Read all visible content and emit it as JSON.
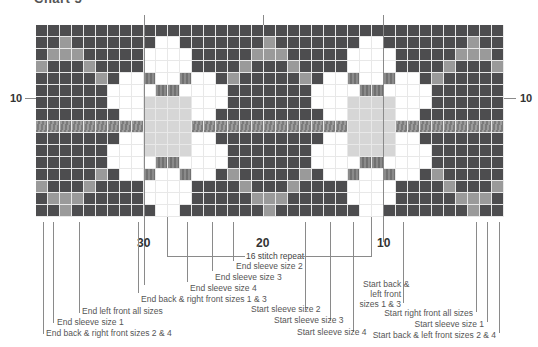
{
  "title": "Chart 5",
  "grid": {
    "cols": 39,
    "rows": 16,
    "legend": {
      "D": "main dark color",
      "G": "grey contrast",
      "W": "white flower",
      "M": "mid grey accent",
      "L": "light grey center",
      "S": "striped band"
    },
    "colors": {
      "D": "#4d4d4f",
      "G": "#9a9a9a",
      "W": "#ffffff",
      "M": "#7a7a7a",
      "L": "#d6d6d6",
      "S": "#8a8a8a"
    },
    "pattern": [
      "DDDDDDDDDDDDDDDDDDDDDDDDDDDDDDDDDDDDDDD",
      "DDGDDDDDDDWWDDDDDDDGDDDDDDDWWDDDDDDDGDD",
      "DGGGDDDDDWWWWDDDDDGGGDDDDDWWWWDDDDDGGGD",
      "GDDDGDDDDWWWWDDDDGDDDGDDDDWWWWDDDDGDDDG",
      "DDDDDGDWWMWWMWWDGDDDDDGDWWMWWMWWDGDDDDD",
      "DDDDDDWWWWMMWWWWDDDDDDDWWWWMMWWWWDDDDDD",
      "DDDDDDWWWLLLLWWWDDDDDDDWWWLLLLWWWDDDDDD",
      "DDDDDDDWWLLLLWWDDDDDDDDDWWLLLLWWDDDDDDD",
      "SSSSSSSSSLLLLSSSSSSSSSSSSSLLLLSSSSSSSSS",
      "DDDDDDDWWLLLLWWDDDDDDDDDWWLLLLWWDDDDDDD",
      "DDDDDDWWWLLLLWWWDDDDDDDWWWLLLLWWWDDDDDD",
      "DDDDDDWWWWMMWWWWDDDDDDDWWWWMMWWWWDDDDDD",
      "DDDDDGDWWMWWMWWDGDDDDDGDWWMWWMWWDGDDDDD",
      "GDDDGDDDDWWWWDDDDGDDDGDDDDWWWWDDDDGDDDG",
      "DGGGDDDDDWWWWDDDDDGGGDDDDDWWWWDDDDDGGGD",
      "DDGDDDDDDDWWDDDDDDDGDDDDDDDWWDDDDDDDGDD"
    ]
  },
  "row_numbers": {
    "left": "10",
    "right": "10"
  },
  "column_numbers": [
    "30",
    "20",
    "10"
  ],
  "repeat_label": "16 stitch repeat",
  "labels_left": [
    "End sleeve size 2",
    "End sleeve size 3",
    "End sleeve size 4",
    "End back & right front sizes 1 & 3",
    "End left front all sizes",
    "End sleeve size 1",
    "End back & right front sizes 2 & 4"
  ],
  "labels_middle": [
    "Start sleeve size 2",
    "Start sleeve size 3",
    "Start sleeve size 4"
  ],
  "labels_right": [
    "Start back &",
    "left front",
    "sizes 1 & 3",
    "Start right front all sizes",
    "Start sleeve size 1",
    "Start back & left front sizes 2 & 4"
  ]
}
